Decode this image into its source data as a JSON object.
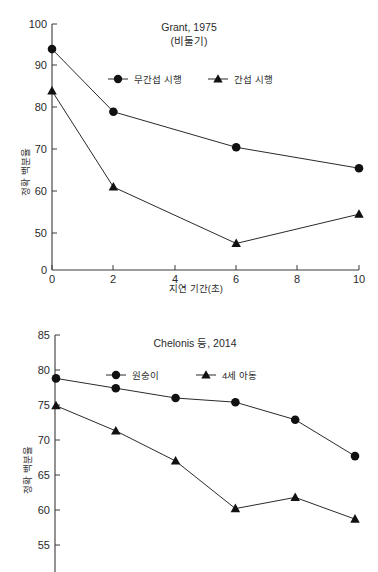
{
  "figures": [
    {
      "id": "grant-1975",
      "title_line1": "Grant, 1975",
      "title_line2": "(비둘기)",
      "xlabel": "지연 기간(초)",
      "ylabel": "정확 백분율",
      "legend": [
        {
          "label": "무간섭 시행",
          "marker": "circle-marker"
        },
        {
          "label": "간섭 시행",
          "marker": "triangle-marker"
        }
      ],
      "yticks": [
        "100",
        "90",
        "80",
        "70",
        "60",
        "50",
        "0"
      ],
      "xticks": [
        "0",
        "2",
        "4",
        "6",
        "8",
        "10"
      ]
    },
    {
      "id": "chelonis-2014",
      "title_line1": "Chelonis 등, 2014",
      "title_line2": "",
      "xlabel": "",
      "ylabel": "정확 백분율",
      "legend": [
        {
          "label": "원숭이",
          "marker": "circle-marker"
        },
        {
          "label": "4세 아동",
          "marker": "triangle-marker"
        }
      ],
      "yticks": [
        "85",
        "80",
        "75",
        "70",
        "65",
        "60",
        "55"
      ],
      "xticks": []
    }
  ],
  "chart_data": [
    {
      "type": "line",
      "title": "Grant, 1975 (비둘기)",
      "xlabel": "지연 기간(초)",
      "ylabel": "정확 백분율",
      "x": [
        0,
        2,
        6,
        10
      ],
      "xlim": [
        0,
        10
      ],
      "ylim": [
        50,
        100
      ],
      "y_axis_break_to_zero": true,
      "xticks": [
        0,
        2,
        4,
        6,
        8,
        10
      ],
      "yticks": [
        50,
        60,
        70,
        80,
        90,
        100
      ],
      "grid": false,
      "legend_position": "upper-center",
      "series": [
        {
          "name": "무간섭 시행",
          "marker": "circle",
          "values": [
            94.0,
            79.0,
            70.5,
            65.5
          ]
        },
        {
          "name": "간섭 시행",
          "marker": "triangle",
          "values": [
            84.0,
            61.0,
            47.5,
            54.5
          ]
        }
      ]
    },
    {
      "type": "line",
      "title": "Chelonis 등, 2014",
      "xlabel": "",
      "ylabel": "정확 백분율",
      "x": [
        0,
        1,
        2,
        3,
        4,
        5
      ],
      "xlim": [
        0,
        5
      ],
      "ylim": [
        55,
        85
      ],
      "y_axis_break_to_zero": false,
      "xticks": [],
      "yticks": [
        55,
        60,
        65,
        70,
        75,
        80,
        85
      ],
      "grid": false,
      "legend_position": "upper-center",
      "series": [
        {
          "name": "원숭이",
          "marker": "circle",
          "values": [
            78.8,
            77.4,
            76.0,
            75.4,
            72.9,
            67.7
          ]
        },
        {
          "name": "4세 아동",
          "marker": "triangle",
          "values": [
            74.9,
            71.3,
            67.0,
            60.2,
            61.8,
            58.7
          ]
        }
      ]
    }
  ]
}
